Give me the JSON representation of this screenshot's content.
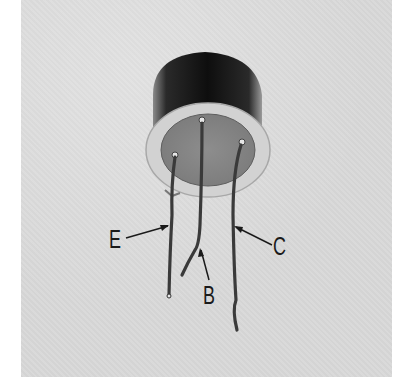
{
  "figure": {
    "background_color": "#d9d9d9",
    "labels": [
      {
        "id": "emitter",
        "text": "E"
      },
      {
        "id": "base",
        "text": "B"
      },
      {
        "id": "collector",
        "text": "C"
      }
    ]
  }
}
